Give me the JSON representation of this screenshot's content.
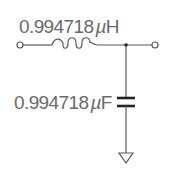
{
  "diagram": {
    "type": "LC low-pass filter schematic",
    "components": [
      {
        "id": "L1",
        "kind": "inductor",
        "label": "0.994718µH",
        "value": "0.994718",
        "unit": "µH"
      },
      {
        "id": "C1",
        "kind": "capacitor",
        "label": "0.994718µF",
        "value": "0.994718",
        "unit": "µF"
      }
    ],
    "terminals": [
      "input",
      "output"
    ],
    "ground": "ground-symbol",
    "colors": {
      "wire": "#5a5a5a",
      "text": "#6a6a6a",
      "background": "#ffffff"
    }
  },
  "labels": {
    "inductor_value": "0.994718",
    "inductor_unit_prefix": "µ",
    "inductor_unit": "H",
    "capacitor_value": "0.994718",
    "capacitor_unit_prefix": "µ",
    "capacitor_unit": "F"
  }
}
